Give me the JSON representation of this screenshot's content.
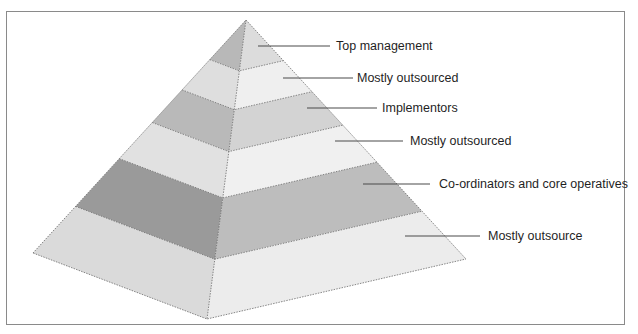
{
  "diagram": {
    "type": "pyramid",
    "levels": [
      {
        "label": "Top management",
        "left_color": "#b8b8b8",
        "right_color": "#dcdcdc"
      },
      {
        "label": "Mostly outsourced",
        "left_color": "#dedede",
        "right_color": "#efefef"
      },
      {
        "label": "Implementors",
        "left_color": "#b9b9b9",
        "right_color": "#d3d3d3"
      },
      {
        "label": "Mostly outsourced",
        "left_color": "#e1e1e1",
        "right_color": "#f0f0f0"
      },
      {
        "label": "Co-ordinators and core operatives",
        "left_color": "#9a9a9a",
        "right_color": "#bdbdbd"
      },
      {
        "label": "Mostly outsource",
        "left_color": "#dadada",
        "right_color": "#ececec"
      }
    ],
    "colors": {
      "frame_border": "#8a8a8a",
      "leader_line": "#4a4a4a",
      "label_text": "#1f1f1f",
      "seam": "#6a6a6a"
    }
  }
}
